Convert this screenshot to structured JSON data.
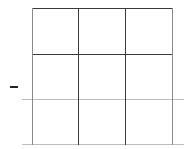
{
  "board": {
    "rows": 3,
    "cols": 3,
    "cells": [
      [
        "",
        "",
        ""
      ],
      [
        "",
        "",
        ""
      ],
      [
        "",
        "",
        ""
      ]
    ]
  },
  "side_marker": {
    "symbol": "–"
  },
  "colors": {
    "grid_dark": "#3a3a3a",
    "grid_light": "#bdbdbd",
    "background": "#ffffff"
  }
}
